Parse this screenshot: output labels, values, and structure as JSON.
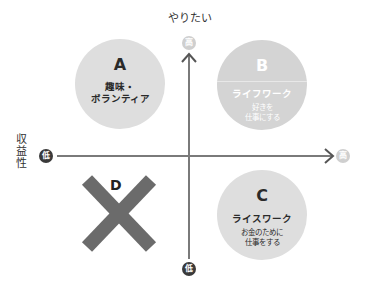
{
  "axes": {
    "y_label": "やりたい",
    "x_label": "収益性",
    "y_high_badge": "高",
    "y_low_badge": "低",
    "x_low_badge": "低",
    "x_high_badge": "高",
    "axis_color": "#7a7a7a"
  },
  "quadrants": [
    {
      "letter": "A",
      "title": "趣味・ボランティア",
      "title_lines": [
        "趣味・",
        "ボランティア"
      ],
      "desc": "",
      "fill": "#dedede"
    },
    {
      "letter": "B",
      "title": "ライフワーク",
      "desc_lines": [
        "好きを",
        "仕事にする"
      ],
      "fill": "#d4d4d4"
    },
    {
      "letter": "C",
      "title": "ライスワーク",
      "desc_lines": [
        "お金のために",
        "仕事をする"
      ],
      "fill": "#dedede"
    },
    {
      "letter": "D",
      "symbol": "cross-mark",
      "fill": "#6b6b6b"
    }
  ],
  "side_label_chars": [
    "収",
    "益",
    "性"
  ]
}
